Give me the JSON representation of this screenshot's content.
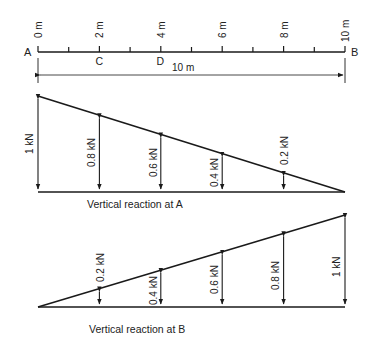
{
  "ruler": {
    "start_label": "A",
    "end_label": "B",
    "tick_labels": [
      "0 m",
      "2 m",
      "4 m",
      "6 m",
      "8 m",
      "10 m"
    ],
    "point_labels": [
      {
        "label": "C",
        "position_m": 2
      },
      {
        "label": "D",
        "position_m": 4
      }
    ],
    "span_label": "10 m"
  },
  "diagram_a": {
    "caption": "Vertical reaction at A",
    "labels": [
      "1 kN",
      "0.8 kN",
      "0.6 kN",
      "0.4 kN",
      "0.2 kN"
    ]
  },
  "diagram_b": {
    "caption": "Vertical reaction at B",
    "labels": [
      "0.2 kN",
      "0.4 kN",
      "0.6 kN",
      "0.8 kN",
      "1 kN"
    ]
  },
  "colors": {
    "line": "#1a1a1a",
    "text": "#222222",
    "background": "#ffffff"
  }
}
